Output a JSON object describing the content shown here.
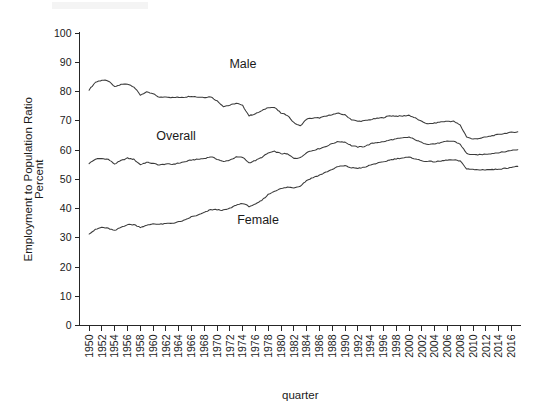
{
  "figure": {
    "background_color": "#ffffff",
    "line_color": "#3a3a3a",
    "axis_color": "#262626"
  },
  "axes": {
    "x_title": "quarter",
    "y_title_line1": "Employment to Population Ratio",
    "y_title_line2": "Percent"
  },
  "series_labels": {
    "male": "Male",
    "overall": "Overall",
    "female": "Female"
  },
  "chart_data": {
    "type": "line",
    "title": "",
    "subtitle": "",
    "xlabel": "quarter",
    "ylabel": "Employment to Population Ratio Percent",
    "xlim": [
      1948.5,
      2017.5
    ],
    "ylim": [
      0,
      100
    ],
    "grid": false,
    "legend": "inline annotations on plot",
    "y_ticks": [
      0,
      10,
      20,
      30,
      40,
      50,
      60,
      70,
      80,
      90,
      100
    ],
    "x_ticks": [
      1950,
      1952,
      1954,
      1956,
      1958,
      1960,
      1962,
      1964,
      1966,
      1968,
      1970,
      1972,
      1974,
      1976,
      1978,
      1980,
      1982,
      1984,
      1986,
      1988,
      1990,
      1992,
      1994,
      1996,
      1998,
      2000,
      2002,
      2004,
      2006,
      2008,
      2010,
      2012,
      2014,
      2016
    ],
    "x": [
      1950,
      1951,
      1952,
      1953,
      1954,
      1955,
      1956,
      1957,
      1958,
      1959,
      1960,
      1961,
      1962,
      1963,
      1964,
      1965,
      1966,
      1967,
      1968,
      1969,
      1970,
      1971,
      1972,
      1973,
      1974,
      1975,
      1976,
      1977,
      1978,
      1979,
      1980,
      1981,
      1982,
      1983,
      1984,
      1985,
      1986,
      1987,
      1988,
      1989,
      1990,
      1991,
      1992,
      1993,
      1994,
      1995,
      1996,
      1997,
      1998,
      1999,
      2000,
      2001,
      2002,
      2003,
      2004,
      2005,
      2006,
      2007,
      2008,
      2009,
      2010,
      2011,
      2012,
      2013,
      2014,
      2015,
      2016,
      2017
    ],
    "series": [
      {
        "name": "Male",
        "values": [
          80.6,
          83.2,
          83.9,
          83.6,
          81.6,
          82.4,
          82.6,
          81.6,
          78.8,
          79.8,
          79.2,
          78.0,
          78.2,
          77.9,
          78.0,
          78.1,
          78.4,
          78.1,
          78.0,
          78.2,
          76.8,
          74.9,
          75.3,
          76.0,
          75.2,
          71.7,
          72.4,
          73.4,
          74.6,
          74.5,
          72.6,
          71.9,
          69.3,
          68.2,
          70.6,
          70.9,
          71.0,
          71.5,
          72.2,
          72.5,
          72.0,
          70.4,
          69.8,
          70.0,
          70.4,
          70.8,
          71.1,
          71.7,
          71.6,
          71.6,
          71.9,
          70.9,
          69.7,
          68.9,
          69.2,
          69.6,
          69.8,
          69.8,
          68.5,
          64.5,
          63.7,
          64.0,
          64.4,
          64.9,
          65.3,
          65.7,
          66.0,
          66.2
        ]
      },
      {
        "name": "Overall",
        "values": [
          55.4,
          56.9,
          57.1,
          56.8,
          55.2,
          56.4,
          57.2,
          56.8,
          55.0,
          55.8,
          55.4,
          54.9,
          55.2,
          55.1,
          55.5,
          56.0,
          56.6,
          56.8,
          57.1,
          57.7,
          56.9,
          56.0,
          56.6,
          57.6,
          57.5,
          55.6,
          56.4,
          57.5,
          59.0,
          59.5,
          58.8,
          58.6,
          57.2,
          57.3,
          59.2,
          59.9,
          60.5,
          61.2,
          62.2,
          62.9,
          62.7,
          61.5,
          61.0,
          61.2,
          62.1,
          62.6,
          62.8,
          63.4,
          63.8,
          64.1,
          64.4,
          63.5,
          62.5,
          62.0,
          62.1,
          62.5,
          63.0,
          63.0,
          62.0,
          58.8,
          58.3,
          58.4,
          58.6,
          58.8,
          59.1,
          59.4,
          59.9,
          60.1
        ]
      },
      {
        "name": "Female",
        "values": [
          31.4,
          32.8,
          33.6,
          33.2,
          32.4,
          33.6,
          34.5,
          34.5,
          33.6,
          34.2,
          34.8,
          34.6,
          34.8,
          35.0,
          35.4,
          36.0,
          37.2,
          37.7,
          38.6,
          39.6,
          39.6,
          39.4,
          40.0,
          41.2,
          41.8,
          40.7,
          41.4,
          42.8,
          44.8,
          46.0,
          46.8,
          47.3,
          47.1,
          47.7,
          49.6,
          50.6,
          51.4,
          52.4,
          53.4,
          54.4,
          54.6,
          53.9,
          53.8,
          54.0,
          54.9,
          55.5,
          55.9,
          56.6,
          57.0,
          57.3,
          57.5,
          57.0,
          56.3,
          56.1,
          56.0,
          56.2,
          56.6,
          56.6,
          56.2,
          53.6,
          53.3,
          53.2,
          53.3,
          53.3,
          53.5,
          53.7,
          54.1,
          54.4
        ]
      }
    ]
  }
}
